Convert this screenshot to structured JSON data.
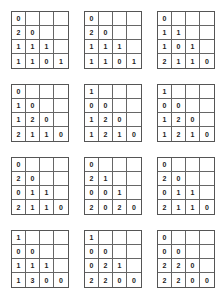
{
  "grids": [
    {
      "rows": [
        [
          "0"
        ],
        [
          "2",
          "0"
        ],
        [
          "1",
          "1",
          "1"
        ],
        [
          "1",
          "1",
          "0",
          "1"
        ]
      ]
    },
    {
      "rows": [
        [
          "0"
        ],
        [
          "2",
          "0"
        ],
        [
          "1",
          "1",
          "1"
        ],
        [
          "1",
          "1",
          "0",
          "1"
        ]
      ]
    },
    {
      "rows": [
        [
          "0"
        ],
        [
          "1",
          "1"
        ],
        [
          "1",
          "0",
          "1"
        ],
        [
          "2",
          "1",
          "1",
          "0"
        ]
      ]
    },
    {
      "rows": [
        [
          "0"
        ],
        [
          "1",
          "0"
        ],
        [
          "1",
          "2",
          "0"
        ],
        [
          "2",
          "1",
          "1",
          "0"
        ]
      ]
    },
    {
      "rows": [
        [
          "1"
        ],
        [
          "0",
          "0"
        ],
        [
          "1",
          "2",
          "0"
        ],
        [
          "1",
          "2",
          "1",
          "0"
        ]
      ]
    },
    {
      "rows": [
        [
          "1"
        ],
        [
          "0",
          "0"
        ],
        [
          "1",
          "2",
          "0"
        ],
        [
          "1",
          "2",
          "1",
          "0"
        ]
      ]
    },
    {
      "rows": [
        [
          "0"
        ],
        [
          "2",
          "0"
        ],
        [
          "0",
          "1",
          "1"
        ],
        [
          "2",
          "1",
          "1",
          "0"
        ]
      ]
    },
    {
      "rows": [
        [
          "0"
        ],
        [
          "2",
          "1"
        ],
        [
          "0",
          "0",
          "1"
        ],
        [
          "2",
          "0",
          "2",
          "0"
        ]
      ]
    },
    {
      "rows": [
        [
          "0"
        ],
        [
          "2",
          "0"
        ],
        [
          "0",
          "1",
          "1"
        ],
        [
          "2",
          "1",
          "1",
          "0"
        ]
      ]
    },
    {
      "rows": [
        [
          "1"
        ],
        [
          "0",
          "0"
        ],
        [
          "1",
          "1",
          "1"
        ],
        [
          "1",
          "3",
          "0",
          "0"
        ]
      ]
    },
    {
      "rows": [
        [
          "1"
        ],
        [
          "0",
          "0"
        ],
        [
          "0",
          "2",
          "1"
        ],
        [
          "2",
          "2",
          "0",
          "0"
        ]
      ]
    },
    {
      "rows": [
        [
          "0"
        ],
        [
          "0",
          "0"
        ],
        [
          "2",
          "2",
          "0"
        ],
        [
          "2",
          "2",
          "0",
          "0"
        ]
      ]
    }
  ]
}
